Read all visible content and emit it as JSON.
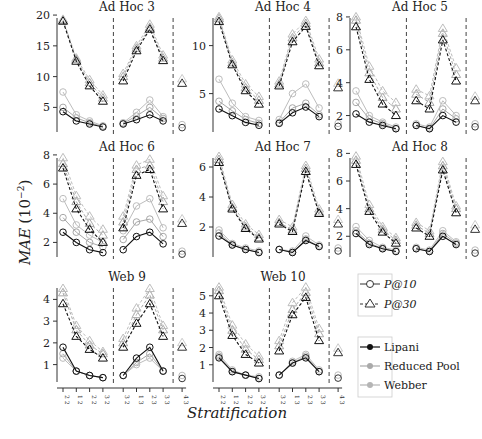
{
  "figure": {
    "ylabel": "MAE (10^-2)",
    "ylabel_main": "MAE",
    "ylabel_unit": "(10",
    "ylabel_exp": "−2",
    "xlabel": "Stratification",
    "xtick_labels": [
      "2 2",
      "1 2",
      "2 2",
      "3 2",
      "3 2",
      "1 3",
      "2 3",
      "3 3",
      "4 3",
      "4 4"
    ]
  },
  "legend": {
    "metrics": [
      {
        "label": "P@10",
        "marker": "circle"
      },
      {
        "label": "P@30",
        "marker": "triangle"
      }
    ],
    "methods": [
      {
        "label": "Lipani",
        "color": "#111111"
      },
      {
        "label": "Reduced Pool",
        "color": "#aaaaaa"
      },
      {
        "label": "Webber",
        "color": "#c8c8c8"
      }
    ]
  },
  "chart_data": [
    {
      "type": "line",
      "title": "Ad Hoc 3",
      "ylim": [
        1,
        20.5
      ],
      "yticks": [
        5,
        10,
        15,
        20
      ],
      "series": [
        {
          "name": "Lipani P@10",
          "values": [
            4.3,
            2.8,
            2.3,
            1.8,
            2.3,
            3.0,
            3.8,
            2.8,
            null,
            null
          ]
        },
        {
          "name": "Reduced Pool P@10",
          "values": [
            7.5,
            3.8,
            2.8,
            2.0,
            2.5,
            4.2,
            6.2,
            3.5,
            null,
            null
          ]
        },
        {
          "name": "Webber P@10",
          "values": [
            5.0,
            3.3,
            2.5,
            1.9,
            2.4,
            3.6,
            5.0,
            3.2,
            null,
            null
          ]
        },
        {
          "name": "Lipani P@30",
          "values": [
            19.0,
            12.5,
            8.5,
            6.0,
            9.3,
            14.2,
            17.7,
            12.6,
            null,
            null
          ]
        },
        {
          "name": "Reduced Pool P@30",
          "values": [
            19.3,
            13.0,
            9.5,
            7.0,
            10.5,
            15.0,
            18.5,
            13.5,
            null,
            null
          ]
        },
        {
          "name": "Webber P@30",
          "values": [
            19.1,
            12.8,
            9.0,
            6.5,
            10.0,
            14.6,
            18.0,
            13.0,
            null,
            null
          ]
        }
      ],
      "singles": {
        "P@10": 2.2,
        "P@30": 8.9
      }
    },
    {
      "type": "line",
      "title": "Ad Hoc 4",
      "ylim": [
        1,
        13.5
      ],
      "yticks": [
        5,
        10
      ],
      "series": [
        {
          "name": "Lipani P@10",
          "values": [
            3.4,
            2.7,
            2.0,
            1.7,
            1.9,
            3.0,
            3.6,
            2.6,
            null,
            null
          ]
        },
        {
          "name": "Reduced Pool P@10",
          "values": [
            6.5,
            4.0,
            2.6,
            2.2,
            2.3,
            5.0,
            6.0,
            3.5,
            null,
            null
          ]
        },
        {
          "name": "Webber P@10",
          "values": [
            4.2,
            3.2,
            2.3,
            1.9,
            2.0,
            3.5,
            4.0,
            2.8,
            null,
            null
          ]
        },
        {
          "name": "Lipani P@30",
          "values": [
            12.5,
            8.0,
            5.3,
            3.9,
            5.8,
            10.4,
            12.0,
            7.9,
            null,
            null
          ]
        },
        {
          "name": "Reduced Pool P@30",
          "values": [
            13.0,
            8.5,
            6.0,
            4.7,
            6.3,
            11.2,
            12.6,
            8.6,
            null,
            null
          ]
        },
        {
          "name": "Webber P@30",
          "values": [
            12.8,
            8.2,
            5.6,
            4.3,
            6.0,
            10.8,
            12.3,
            8.2,
            null,
            null
          ]
        }
      ],
      "singles": {
        "P@10": 1.9,
        "P@30": 5.6
      }
    },
    {
      "type": "line",
      "title": "Ad Hoc 5",
      "ylim": [
        1,
        8.3
      ],
      "yticks": [
        2,
        4,
        6,
        8
      ],
      "series": [
        {
          "name": "Lipani P@10",
          "values": [
            2.1,
            1.6,
            1.4,
            1.2,
            1.4,
            1.2,
            2.0,
            1.6,
            null,
            null
          ]
        },
        {
          "name": "Reduced Pool P@10",
          "values": [
            3.5,
            2.0,
            1.6,
            1.3,
            1.5,
            1.3,
            2.9,
            2.0,
            null,
            null
          ]
        },
        {
          "name": "Webber P@10",
          "values": [
            2.8,
            1.8,
            1.5,
            1.2,
            1.4,
            1.2,
            2.4,
            1.8,
            null,
            null
          ]
        },
        {
          "name": "Lipani P@30",
          "values": [
            7.4,
            4.2,
            2.7,
            2.0,
            2.9,
            2.4,
            6.6,
            4.1,
            null,
            null
          ]
        },
        {
          "name": "Reduced Pool P@30",
          "values": [
            8.0,
            5.0,
            3.5,
            2.8,
            3.6,
            3.2,
            7.3,
            4.9,
            null,
            null
          ]
        },
        {
          "name": "Webber P@30",
          "values": [
            7.8,
            4.6,
            3.1,
            2.4,
            3.3,
            2.8,
            7.0,
            4.5,
            null,
            null
          ]
        }
      ],
      "singles": {
        "P@10": 1.5,
        "P@30": 2.9
      }
    },
    {
      "type": "line",
      "title": "Ad Hoc 6",
      "ylim": [
        1,
        8.2
      ],
      "yticks": [
        2,
        4,
        6,
        8
      ],
      "series": [
        {
          "name": "Lipani P@10",
          "values": [
            2.7,
            2.0,
            1.5,
            1.3,
            1.5,
            2.4,
            2.7,
            1.9,
            null,
            null
          ]
        },
        {
          "name": "Reduced Pool P@10",
          "values": [
            5.0,
            3.2,
            2.5,
            2.0,
            2.8,
            4.5,
            5.0,
            3.0,
            null,
            null
          ]
        },
        {
          "name": "Webber P@10",
          "values": [
            3.7,
            2.7,
            2.0,
            1.7,
            2.2,
            3.4,
            3.6,
            2.4,
            null,
            null
          ]
        },
        {
          "name": "Lipani P@30",
          "values": [
            7.1,
            4.3,
            2.9,
            2.0,
            3.0,
            6.6,
            7.0,
            4.3,
            null,
            null
          ]
        },
        {
          "name": "Reduced Pool P@30",
          "values": [
            7.8,
            5.2,
            3.8,
            2.9,
            3.8,
            7.3,
            7.7,
            5.2,
            null,
            null
          ]
        },
        {
          "name": "Webber P@30",
          "values": [
            7.4,
            4.8,
            3.3,
            2.5,
            3.4,
            7.0,
            7.3,
            4.8,
            null,
            null
          ]
        }
      ],
      "singles": {
        "P@10": 1.4,
        "P@30": 3.3
      }
    },
    {
      "type": "line",
      "title": "Ad Hoc 7",
      "ylim": [
        0,
        7.0
      ],
      "yticks": [
        2,
        4,
        6
      ],
      "series": [
        {
          "name": "Lipani P@10",
          "values": [
            1.4,
            0.8,
            0.5,
            0.3,
            0.5,
            0.3,
            1.1,
            0.7,
            null,
            null
          ]
        },
        {
          "name": "Reduced Pool P@10",
          "values": [
            1.8,
            0.9,
            0.6,
            0.4,
            0.5,
            0.4,
            1.4,
            0.8,
            null,
            null
          ]
        },
        {
          "name": "Webber P@10",
          "values": [
            1.6,
            0.8,
            0.5,
            0.3,
            0.5,
            0.3,
            1.2,
            0.7,
            null,
            null
          ]
        },
        {
          "name": "Lipani P@30",
          "values": [
            6.3,
            3.2,
            1.9,
            1.2,
            2.2,
            1.7,
            5.7,
            2.9,
            null,
            null
          ]
        },
        {
          "name": "Reduced Pool P@30",
          "values": [
            6.7,
            3.5,
            2.2,
            1.5,
            2.5,
            2.0,
            6.1,
            3.2,
            null,
            null
          ]
        },
        {
          "name": "Webber P@30",
          "values": [
            6.5,
            3.3,
            2.0,
            1.3,
            2.3,
            1.8,
            5.9,
            3.0,
            null,
            null
          ]
        }
      ],
      "singles": {
        "P@10": 0.6,
        "P@30": 2.2
      }
    },
    {
      "type": "line",
      "title": "Ad Hoc 8",
      "ylim": [
        0.5,
        8.1
      ],
      "yticks": [
        2,
        4,
        6,
        8
      ],
      "series": [
        {
          "name": "Lipani P@10",
          "values": [
            2.2,
            1.4,
            1.1,
            0.9,
            1.1,
            0.9,
            2.0,
            1.4,
            null,
            null
          ]
        },
        {
          "name": "Reduced Pool P@10",
          "values": [
            2.7,
            1.7,
            1.2,
            1.0,
            1.2,
            1.0,
            2.4,
            1.6,
            null,
            null
          ]
        },
        {
          "name": "Webber P@10",
          "values": [
            2.4,
            1.5,
            1.1,
            0.9,
            1.1,
            0.9,
            2.2,
            1.5,
            null,
            null
          ]
        },
        {
          "name": "Lipani P@30",
          "values": [
            7.2,
            3.8,
            2.3,
            1.5,
            2.6,
            2.0,
            6.8,
            3.7,
            null,
            null
          ]
        },
        {
          "name": "Reduced Pool P@30",
          "values": [
            7.8,
            4.3,
            2.7,
            1.9,
            3.0,
            2.4,
            7.4,
            4.2,
            null,
            null
          ]
        },
        {
          "name": "Webber P@30",
          "values": [
            7.5,
            4.0,
            2.5,
            1.7,
            2.8,
            2.2,
            7.1,
            4.0,
            null,
            null
          ]
        }
      ],
      "singles": {
        "P@10": 1.0,
        "P@30": 2.5
      }
    },
    {
      "type": "line",
      "title": "Web 9",
      "ylim": [
        0.2,
        4.8
      ],
      "yticks": [
        1,
        2,
        3,
        4
      ],
      "series": [
        {
          "name": "Lipani P@10",
          "values": [
            1.8,
            0.7,
            0.5,
            0.4,
            0.5,
            1.3,
            1.8,
            0.7,
            null,
            null
          ]
        },
        {
          "name": "Reduced Pool P@10",
          "values": [
            1.3,
            0.7,
            0.5,
            0.4,
            0.5,
            1.0,
            1.3,
            0.7,
            null,
            null
          ]
        },
        {
          "name": "Webber P@10",
          "values": [
            1.5,
            0.7,
            0.5,
            0.4,
            0.5,
            1.1,
            1.5,
            0.7,
            null,
            null
          ]
        },
        {
          "name": "Lipani P@30",
          "values": [
            3.8,
            2.3,
            1.7,
            1.3,
            1.8,
            2.9,
            3.8,
            2.3,
            null,
            null
          ]
        },
        {
          "name": "Reduced Pool P@30",
          "values": [
            4.5,
            2.8,
            2.1,
            1.6,
            2.2,
            3.6,
            4.5,
            2.8,
            null,
            null
          ]
        },
        {
          "name": "Webber P@30",
          "values": [
            4.3,
            2.6,
            1.9,
            1.5,
            2.0,
            3.3,
            4.2,
            2.6,
            null,
            null
          ]
        }
      ],
      "singles": {
        "P@10": 0.5,
        "P@30": 1.8
      }
    },
    {
      "type": "line",
      "title": "Web 10",
      "ylim": [
        0,
        5.8
      ],
      "yticks": [
        1,
        2,
        3,
        4,
        5
      ],
      "series": [
        {
          "name": "Lipani P@10",
          "values": [
            1.4,
            0.6,
            0.4,
            0.2,
            0.4,
            1.1,
            1.4,
            0.6,
            null,
            null
          ]
        },
        {
          "name": "Reduced Pool P@10",
          "values": [
            1.6,
            0.7,
            0.4,
            0.3,
            0.4,
            1.2,
            1.6,
            0.7,
            null,
            null
          ]
        },
        {
          "name": "Webber P@10",
          "values": [
            1.5,
            0.6,
            0.4,
            0.2,
            0.4,
            1.1,
            1.5,
            0.6,
            null,
            null
          ]
        },
        {
          "name": "Lipani P@30",
          "values": [
            5.0,
            2.7,
            1.6,
            1.1,
            1.8,
            3.9,
            4.9,
            2.4,
            null,
            null
          ]
        },
        {
          "name": "Reduced Pool P@30",
          "values": [
            5.5,
            3.3,
            2.2,
            1.5,
            2.4,
            4.6,
            5.5,
            3.1,
            null,
            null
          ]
        },
        {
          "name": "Webber P@30",
          "values": [
            5.3,
            3.0,
            1.9,
            1.3,
            2.1,
            4.2,
            5.2,
            2.8,
            null,
            null
          ]
        }
      ],
      "singles": {
        "P@10": 0.4,
        "P@30": 1.7
      }
    }
  ]
}
